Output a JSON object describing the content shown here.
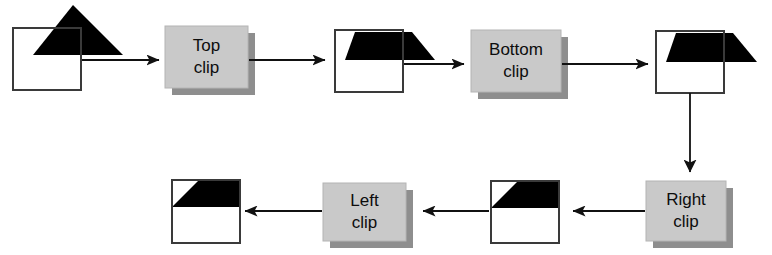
{
  "diagram": {
    "type": "flow-diagram",
    "background_color": "#ffffff",
    "shape_fill_color": "#000000",
    "box_stroke_color": "#3a3a3a",
    "process_fill_color": "#c9c9c9",
    "process_shadow_color": "#8e8e8e",
    "process_text_color": "#0d0d0d",
    "connector_color": "#1a1a1a",
    "stages": [
      {
        "id": "stage-input",
        "kind": "shape",
        "name": "input-triangle-with-window",
        "description": "triangle overlapping clip window, unclipped"
      },
      {
        "id": "stage-top-clip",
        "kind": "process",
        "name": "top-clip-process",
        "label_line1": "Top",
        "label_line2": "clip"
      },
      {
        "id": "stage-after-top",
        "kind": "shape",
        "name": "top-clipped-shape",
        "description": "triangle with apex removed above window top"
      },
      {
        "id": "stage-bottom-clip",
        "kind": "process",
        "name": "bottom-clip-process",
        "label_line1": "Bottom",
        "label_line2": "clip"
      },
      {
        "id": "stage-after-bottom",
        "kind": "shape",
        "name": "bottom-clipped-shape",
        "description": "trapezoid clipped at window bottom edge"
      },
      {
        "id": "stage-right-clip",
        "kind": "process",
        "name": "right-clip-process",
        "label_line1": "Right",
        "label_line2": "clip"
      },
      {
        "id": "stage-after-right",
        "kind": "shape",
        "name": "right-clipped-shape",
        "description": "shape clipped at window right edge"
      },
      {
        "id": "stage-left-clip",
        "kind": "process",
        "name": "left-clip-process",
        "label_line1": "Left",
        "label_line2": "clip"
      },
      {
        "id": "stage-result",
        "kind": "shape",
        "name": "final-clipped-shape",
        "description": "fully clipped polygon inside window"
      }
    ],
    "connectors": [
      {
        "name": "arrow-input-to-top-clip",
        "direction": "right"
      },
      {
        "name": "arrow-top-clip-to-shape2",
        "direction": "right"
      },
      {
        "name": "arrow-shape2-to-bottom-clip",
        "direction": "right"
      },
      {
        "name": "arrow-bottom-clip-to-shape3",
        "direction": "right"
      },
      {
        "name": "arrow-shape3-to-right-clip",
        "direction": "down"
      },
      {
        "name": "arrow-right-clip-to-shape4",
        "direction": "left"
      },
      {
        "name": "arrow-shape4-to-left-clip",
        "direction": "left"
      },
      {
        "name": "arrow-left-clip-to-result",
        "direction": "left"
      }
    ]
  }
}
